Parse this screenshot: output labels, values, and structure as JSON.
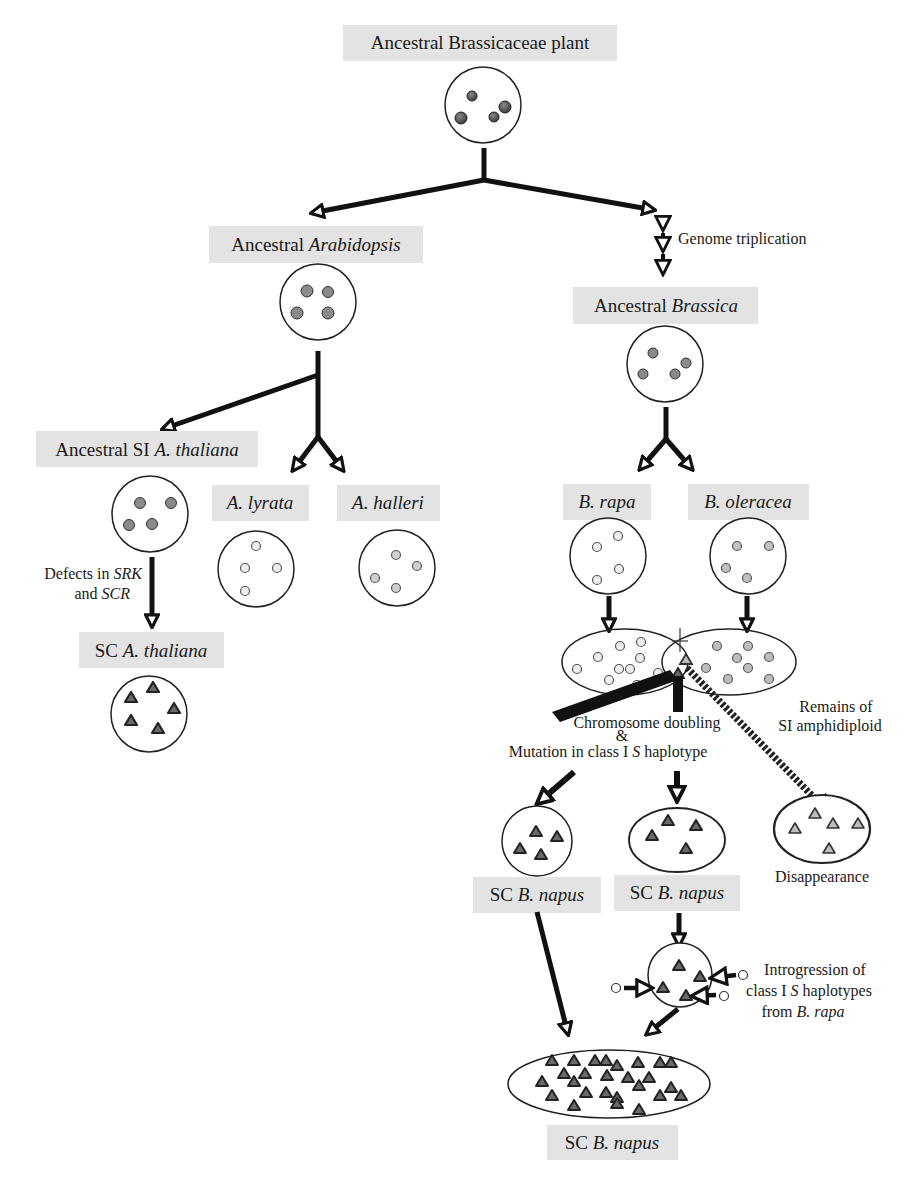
{
  "colors": {
    "label_bg": "#e3e3e3",
    "dot_dark": "#5a5a5a",
    "dot_medium": "#8a8a8a",
    "dot_light": "#d8d8d8",
    "dot_lighter": "#eeeeee",
    "triangle_dark": "#6a6a6a",
    "triangle_light": "#bdbdbd",
    "line": "#111111"
  },
  "nodes": {
    "root": {
      "label": "Ancestral Brassicaceae plant"
    },
    "arabidopsis": {
      "label_plain": "Ancestral ",
      "label_italic": "Arabidopsis"
    },
    "brassica": {
      "label_plain": "Ancestral ",
      "label_italic": "Brassica"
    },
    "si_thaliana": {
      "label_plain": "Ancestral SI ",
      "label_italic": "A. thaliana"
    },
    "lyrata": {
      "label_italic": "A. lyrata"
    },
    "halleri": {
      "label_italic": "A. halleri"
    },
    "sc_thaliana": {
      "label_plain": "SC ",
      "label_italic": "A. thaliana"
    },
    "rapa": {
      "label_italic": "B. rapa"
    },
    "oleracea": {
      "label_italic": "B. oleracea"
    },
    "sc_napus_1": {
      "label_plain": "SC ",
      "label_italic": "B. napus"
    },
    "sc_napus_2": {
      "label_plain": "SC ",
      "label_italic": "B. napus"
    },
    "sc_napus_final": {
      "label_plain": "SC ",
      "label_italic": "B. napus"
    }
  },
  "annotations": {
    "genome_triplication": "Genome triplication",
    "defects_line1_plain": "Defects in ",
    "defects_line1_italic": "SRK",
    "defects_line2_plain": "and ",
    "defects_line2_italic": "SCR",
    "chromosome_doubling": "Chromosome doubling",
    "ampersand": "&",
    "mutation_plain": "Mutation in class I ",
    "mutation_italic": "S",
    "mutation_end": " haplotype",
    "remains_line1": "Remains of",
    "remains_line2": "SI amphidiploid",
    "disappearance": "Disappearance",
    "introgression_line1": "Introgression of",
    "introgression_line2_plain": "class I ",
    "introgression_line2_italic": "S",
    "introgression_line2_end": " haplotypes",
    "introgression_line3_plain": "from ",
    "introgression_line3_italic": "B. rapa"
  }
}
